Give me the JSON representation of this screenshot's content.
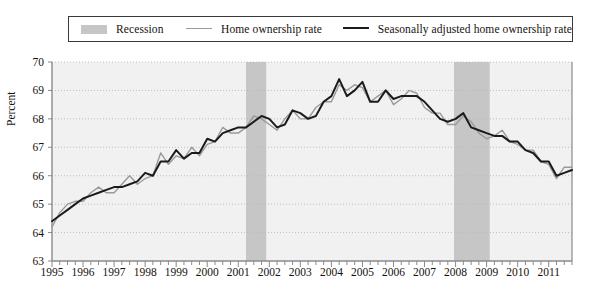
{
  "legend": {
    "items": [
      {
        "name": "recession",
        "label": "Recession",
        "marker": "band",
        "color": "#c6c6c6"
      },
      {
        "name": "home-ownership-rate",
        "label": "Home ownership rate",
        "marker": "line",
        "color": "#9a9a9a"
      },
      {
        "name": "seasonally-adjusted-home-ownership-rate",
        "label": "Seasonally adjusted home ownership rate",
        "marker": "line",
        "color": "#1b1b1b"
      }
    ]
  },
  "chart_data": {
    "type": "line",
    "title": "",
    "xlabel": "",
    "ylabel": "Percent",
    "ylim": [
      63,
      70
    ],
    "xlim": [
      1995.0,
      2011.75
    ],
    "grid": true,
    "legend_position": "top",
    "yticks": [
      63,
      64,
      65,
      66,
      67,
      68,
      69,
      70
    ],
    "ytick_labels": [
      "63",
      "64",
      "65",
      "66",
      "67",
      "68",
      "69",
      "70"
    ],
    "xticks": [
      1995,
      1996,
      1997,
      1998,
      1999,
      2000,
      2001,
      2002,
      2003,
      2004,
      2005,
      2006,
      2007,
      2008,
      2009,
      2010,
      2011
    ],
    "xtick_labels": [
      "1995",
      "1996",
      "1997",
      "1998",
      "1999",
      "2000",
      "2001",
      "2002",
      "2003",
      "2004",
      "2005",
      "2006",
      "2007",
      "2008",
      "2009",
      "2010",
      "2011"
    ],
    "minor_tick_interval": 0.25,
    "x": [
      1995.0,
      1995.25,
      1995.5,
      1995.75,
      1996.0,
      1996.25,
      1996.5,
      1996.75,
      1997.0,
      1997.25,
      1997.5,
      1997.75,
      1998.0,
      1998.25,
      1998.5,
      1998.75,
      1999.0,
      1999.25,
      1999.5,
      1999.75,
      2000.0,
      2000.25,
      2000.5,
      2000.75,
      2001.0,
      2001.25,
      2001.5,
      2001.75,
      2002.0,
      2002.25,
      2002.5,
      2002.75,
      2003.0,
      2003.25,
      2003.5,
      2003.75,
      2004.0,
      2004.25,
      2004.5,
      2004.75,
      2005.0,
      2005.25,
      2005.5,
      2005.75,
      2006.0,
      2006.25,
      2006.5,
      2006.75,
      2007.0,
      2007.25,
      2007.5,
      2007.75,
      2008.0,
      2008.25,
      2008.5,
      2008.75,
      2009.0,
      2009.25,
      2009.5,
      2009.75,
      2010.0,
      2010.25,
      2010.5,
      2010.75,
      2011.0,
      2011.25,
      2011.5,
      2011.75
    ],
    "series": [
      {
        "name": "Home ownership rate",
        "color": "#9a9a9a",
        "width": 1.4,
        "values": [
          64.2,
          64.7,
          65.0,
          65.1,
          65.1,
          65.4,
          65.6,
          65.4,
          65.4,
          65.7,
          66.0,
          65.7,
          65.9,
          66.0,
          66.8,
          66.4,
          66.7,
          66.6,
          67.0,
          66.7,
          67.1,
          67.2,
          67.7,
          67.5,
          67.5,
          67.7,
          68.1,
          68.0,
          67.8,
          67.6,
          68.0,
          68.3,
          68.0,
          68.0,
          68.4,
          68.6,
          68.6,
          69.2,
          69.0,
          69.2,
          69.1,
          68.6,
          68.8,
          69.0,
          68.5,
          68.7,
          69.0,
          68.9,
          68.4,
          68.2,
          68.2,
          67.8,
          67.8,
          68.1,
          67.9,
          67.5,
          67.3,
          67.4,
          67.6,
          67.2,
          67.1,
          66.9,
          66.9,
          66.5,
          66.4,
          65.9,
          66.3,
          66.3
        ]
      },
      {
        "name": "Seasonally adjusted home ownership rate",
        "color": "#1b1b1b",
        "width": 2.0,
        "values": [
          64.4,
          64.6,
          64.8,
          65.0,
          65.2,
          65.3,
          65.4,
          65.5,
          65.6,
          65.6,
          65.7,
          65.8,
          66.1,
          66.0,
          66.5,
          66.5,
          66.9,
          66.6,
          66.8,
          66.8,
          67.3,
          67.2,
          67.5,
          67.6,
          67.7,
          67.7,
          67.9,
          68.1,
          68.0,
          67.7,
          67.8,
          68.3,
          68.2,
          68.0,
          68.1,
          68.6,
          68.8,
          69.4,
          68.8,
          69.0,
          69.3,
          68.6,
          68.6,
          69.0,
          68.7,
          68.8,
          68.8,
          68.8,
          68.6,
          68.3,
          68.0,
          67.9,
          68.0,
          68.2,
          67.7,
          67.6,
          67.5,
          67.4,
          67.4,
          67.2,
          67.2,
          66.9,
          66.8,
          66.5,
          66.5,
          66.0,
          66.1,
          66.2
        ]
      }
    ],
    "recessions": [
      {
        "name": "recession-2001",
        "start": 2001.25,
        "end": 2001.9
      },
      {
        "name": "recession-2008",
        "start": 2007.95,
        "end": 2009.1
      }
    ],
    "background_color": "#f1f1f1",
    "gridline_color": "#b9b9b9",
    "axis_color": "#8a8a8a"
  }
}
